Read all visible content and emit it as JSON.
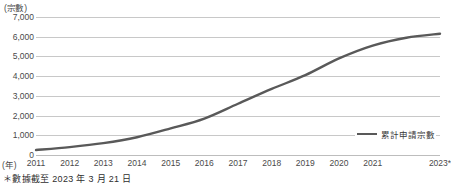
{
  "chart_data": {
    "type": "line",
    "title": "",
    "subtitle": "",
    "xlabel": "(年)",
    "ylabel": "(宗數)",
    "ylim": [
      0,
      7000
    ],
    "ytick_step": 1000,
    "ytick_labels": [
      "7,000",
      "6,000",
      "5,000",
      "4,000",
      "3,000",
      "2,000",
      "1,000",
      "0"
    ],
    "ytick_values": [
      7000,
      6000,
      5000,
      4000,
      3000,
      2000,
      1000,
      0
    ],
    "grid": true,
    "legend_position": "bottom-right",
    "categories": [
      "2011",
      "2012",
      "2013",
      "2014",
      "2015",
      "2016",
      "2017",
      "2018",
      "2019",
      "2020",
      "2021",
      "2022",
      "2023*"
    ],
    "xtick_labels": [
      "2011",
      "2012",
      "2013",
      "2014",
      "2015",
      "2016",
      "2017",
      "2018",
      "2019",
      "2020",
      "2021",
      "",
      "2023*"
    ],
    "series": [
      {
        "name": "累計申請宗數",
        "color": "#595959",
        "values": [
          250,
          400,
          600,
          900,
          1350,
          1850,
          2600,
          3350,
          4050,
          4900,
          5550,
          5950,
          6150
        ]
      }
    ],
    "annotations": [
      "＊數據截至 2023 年 3 月 21 日"
    ]
  },
  "legend": {
    "entries": [
      {
        "label": "累計申請宗數",
        "color": "#595959"
      }
    ]
  },
  "footnote": {
    "text": "＊數據截至 2023 年 3 月 21 日"
  }
}
